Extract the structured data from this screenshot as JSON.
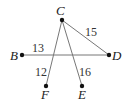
{
  "diagram": {
    "points": [
      {
        "name": "C",
        "x": 62,
        "y": 20,
        "label_x": 58,
        "label_y": 15
      },
      {
        "name": "B",
        "x": 22,
        "y": 55,
        "label_x": 10,
        "label_y": 59
      },
      {
        "name": "D",
        "x": 109,
        "y": 55,
        "label_x": 113,
        "label_y": 60
      },
      {
        "name": "F",
        "x": 46,
        "y": 86,
        "label_x": 41,
        "label_y": 99
      },
      {
        "name": "E",
        "x": 82,
        "y": 86,
        "label_x": 78,
        "label_y": 99
      }
    ],
    "segments": [
      {
        "from": "B",
        "to": "D",
        "length": "13",
        "label_x": 33,
        "label_y": 52
      },
      {
        "from": "C",
        "to": "D",
        "length": "15",
        "label_x": 86,
        "label_y": 36
      },
      {
        "from": "C",
        "to": "F",
        "length": "12",
        "label_x": 36,
        "label_y": 75
      },
      {
        "from": "C",
        "to": "E",
        "length": "16",
        "label_x": 78,
        "label_y": 75
      }
    ]
  }
}
